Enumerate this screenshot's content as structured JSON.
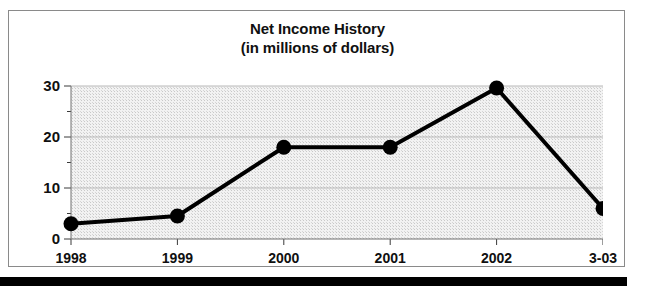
{
  "chart_data": {
    "type": "line",
    "title": "Net Income History",
    "subtitle": "(in millions of dollars)",
    "xlabel": "",
    "ylabel": "",
    "categories": [
      "1998",
      "1999",
      "2000",
      "2001",
      "2002",
      "3-03"
    ],
    "values": [
      3,
      4.5,
      18,
      18,
      29.6,
      6
    ],
    "ylim": [
      0,
      30
    ],
    "yticks": [
      0,
      10,
      20,
      30
    ],
    "ytick_labels": [
      "0",
      "10",
      "20",
      "30"
    ],
    "yminorticks": [
      5,
      15,
      25
    ],
    "grid": "horizontal",
    "legend": "none",
    "marker": "filled-circle",
    "series_color": "#000000",
    "plot_background": "#e8e8e8"
  },
  "figure": {
    "title_line1": "Net Income History",
    "title_line2": "(in millions of dollars)"
  }
}
